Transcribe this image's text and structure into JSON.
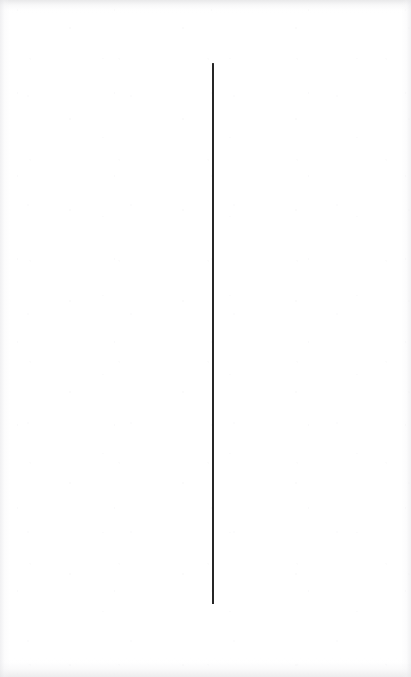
{
  "page": {
    "width_px": 411,
    "height_px": 677,
    "background_color": "#ffffff",
    "content_description": "Blank white scanned page containing a single thin dark vertical line"
  },
  "marks": {
    "vertical_rule": {
      "name": "vertical-rule",
      "color": "#262626",
      "x_center_px": 213,
      "top_px": 63,
      "bottom_px": 604,
      "length_px": 541,
      "thickness_px": 1.6,
      "orientation": "vertical"
    }
  },
  "paper": {
    "edge_shadow_color": "#e4e4e7",
    "grain_color": "#f2f2f4",
    "edges": [
      {
        "name": "top-edge-shadow",
        "side": "top"
      },
      {
        "name": "bottom-edge-shadow",
        "side": "bottom"
      },
      {
        "name": "left-edge-shadow",
        "side": "left"
      },
      {
        "name": "right-edge-shadow",
        "side": "right"
      }
    ]
  }
}
